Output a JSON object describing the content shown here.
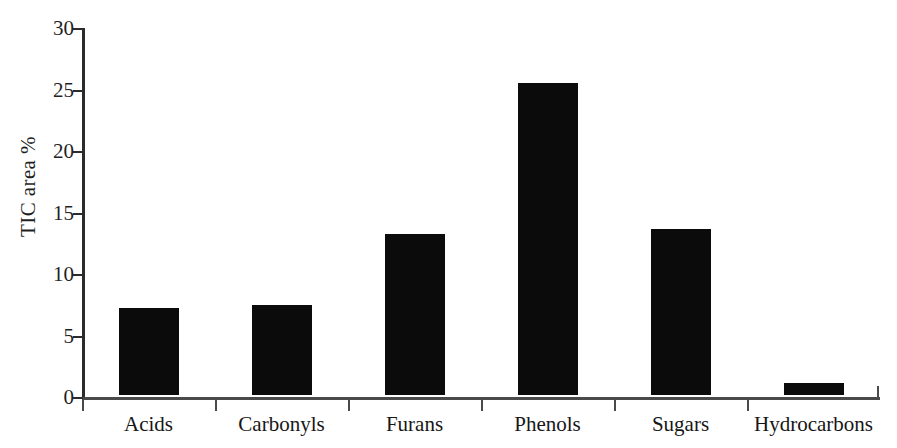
{
  "chart_data": {
    "type": "bar",
    "title": "",
    "xlabel": "",
    "ylabel": "TIC area %",
    "categories": [
      "Acids",
      "Carbonyls",
      "Furans",
      "Phenols",
      "Sugars",
      "Hydrocarbons"
    ],
    "values": [
      7.1,
      7.35,
      13.1,
      25.4,
      13.5,
      0.95
    ],
    "ylim": [
      0,
      30
    ],
    "ytick_labels": [
      "0",
      "5",
      "10",
      "15",
      "20",
      "25",
      "30"
    ],
    "ytick_values": [
      0,
      5,
      10,
      15,
      20,
      25,
      30
    ],
    "grid": false,
    "legend": "none",
    "bar_color": "#0b0b0b",
    "axis_color": "#2b2b2b",
    "background_color": "#ffffff"
  }
}
